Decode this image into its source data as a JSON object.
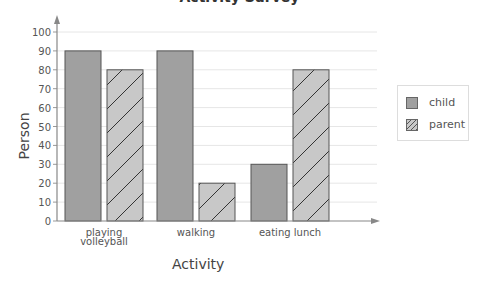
{
  "chart_data": {
    "type": "bar",
    "title": "Activity Survey",
    "xlabel": "Activity",
    "ylabel": "Person",
    "categories": [
      "playing volleyball",
      "walking",
      "eating lunch"
    ],
    "category_labels": [
      [
        "playing",
        "volleyball"
      ],
      [
        "walking"
      ],
      [
        "eating lunch"
      ]
    ],
    "series": [
      {
        "name": "child",
        "values": [
          90,
          90,
          30
        ],
        "fill": "#a0a0a0",
        "pattern": "solid"
      },
      {
        "name": "parent",
        "values": [
          80,
          20,
          80
        ],
        "fill": "#c8c8c8",
        "pattern": "diagonal-hatch"
      }
    ],
    "ylim": [
      0,
      100
    ],
    "yticks": [
      0,
      10,
      20,
      30,
      40,
      50,
      60,
      70,
      80,
      90,
      100
    ],
    "grid": true,
    "legend_position": "right"
  },
  "legend": {
    "items": [
      {
        "label": "child"
      },
      {
        "label": "parent"
      }
    ]
  }
}
